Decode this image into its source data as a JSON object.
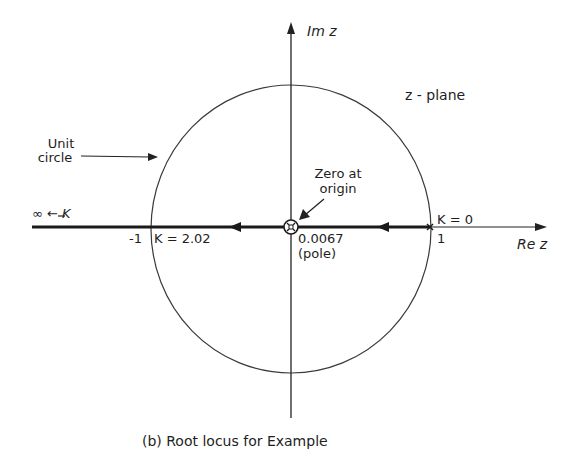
{
  "diagram": {
    "plane_label": "z - plane",
    "axes": {
      "imag_label": "Im z",
      "real_label": "Re z"
    },
    "unit_circle": {
      "label_line1": "Unit",
      "label_line2": "circle"
    },
    "zero": {
      "label_line1": "Zero at",
      "label_line2": "origin"
    },
    "pole": {
      "value": "0.0067",
      "note": "(pole)"
    },
    "points": {
      "minus_one": "-1",
      "one": "1",
      "k_breakaway": "K = 2.02",
      "k_zero": "K = 0",
      "k_infinity": "∞ ← K"
    },
    "caption": "(b) Root locus for Example"
  }
}
